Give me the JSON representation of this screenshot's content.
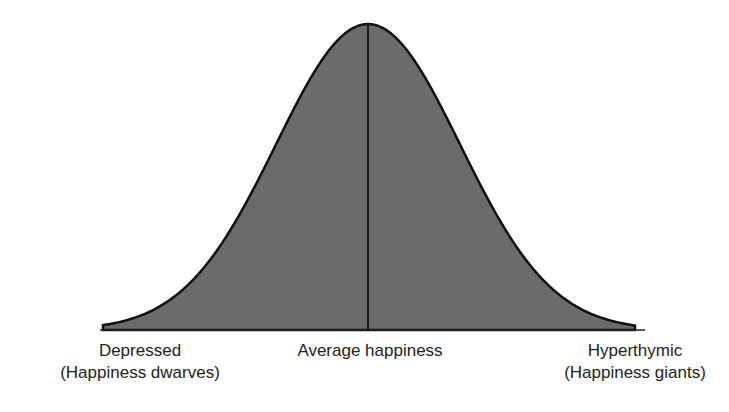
{
  "chart_data": {
    "type": "area",
    "title": "",
    "xlabel": "",
    "ylabel": "",
    "distribution": {
      "shape": "normal",
      "mean_label": "Average happiness"
    },
    "x_labels": [
      {
        "position": "left",
        "lines": [
          "Depressed",
          "(Happiness dwarves)"
        ]
      },
      {
        "position": "center",
        "lines": [
          "Average happiness"
        ]
      },
      {
        "position": "right",
        "lines": [
          "Hyperthymic",
          "(Happiness giants)"
        ]
      }
    ],
    "colors": {
      "fill": "#6b6b6b",
      "stroke": "#111111"
    }
  },
  "labels": {
    "left_line1": "Depressed",
    "left_line2": "(Happiness dwarves)",
    "center": "Average happiness",
    "right_line1": "Hyperthymic",
    "right_line2": "(Happiness giants)"
  }
}
